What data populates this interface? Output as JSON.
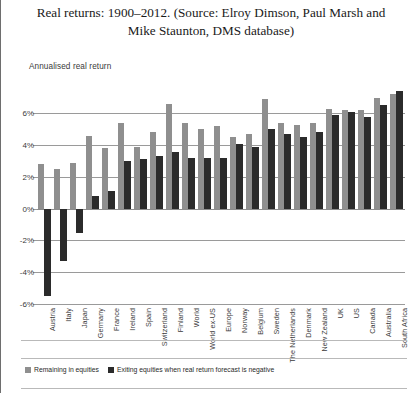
{
  "figure": {
    "title": "Real returns: 1900–2012. (Source: Elroy Dimson, Paul Marsh and Mike Staunton, DMS database)",
    "axis_title": "Annualised real return"
  },
  "legend": {
    "position": "bottom-left",
    "items": [
      {
        "label": "Remaining in equities",
        "color": "#8f8f8f",
        "icon": "square-swatch-light"
      },
      {
        "label": "Exiting equities when real return forecast is negative",
        "color": "#2b2b2b",
        "icon": "square-swatch-dark"
      }
    ]
  },
  "chart_data": {
    "type": "bar",
    "title": "Real returns: 1900–2012. (Source: Elroy Dimson, Paul Marsh and Mike Staunton, DMS database)",
    "xlabel": "",
    "ylabel": "Annualised real return",
    "ylim": [
      -6,
      7.6
    ],
    "yticks": [
      "6%",
      "4%",
      "2%",
      "0%",
      "-2%",
      "-4%",
      "-6%"
    ],
    "ytick_values": [
      6,
      4,
      2,
      0,
      -2,
      -4,
      -6
    ],
    "grid": true,
    "legend_position": "bottom-left",
    "categories": [
      "Austria",
      "Italy",
      "Japan",
      "Germany",
      "France",
      "Ireland",
      "Spain",
      "Switzerland",
      "Finland",
      "World",
      "World ex-US",
      "Europe",
      "Norway",
      "Belgium",
      "Sweden",
      "The Netherlands",
      "Denmark",
      "New Zealand",
      "UK",
      "US",
      "Canada",
      "Australia",
      "South Africa"
    ],
    "series": [
      {
        "name": "Remaining in equities",
        "color": "#8f8f8f",
        "values": [
          2.8,
          2.5,
          2.9,
          4.6,
          3.8,
          5.4,
          3.9,
          4.8,
          6.6,
          5.4,
          5.0,
          5.2,
          4.5,
          4.7,
          6.9,
          5.4,
          5.3,
          5.4,
          6.3,
          6.2,
          6.2,
          7.0,
          7.2
        ]
      },
      {
        "name": "Exiting equities when real return forecast is negative",
        "color": "#2b2b2b",
        "values": [
          -5.5,
          -3.3,
          -1.5,
          0.8,
          1.1,
          3.0,
          3.1,
          3.3,
          3.6,
          3.2,
          3.2,
          3.2,
          4.1,
          3.9,
          5.0,
          4.7,
          4.5,
          4.8,
          5.9,
          6.1,
          5.8,
          6.5,
          7.4
        ]
      }
    ]
  }
}
